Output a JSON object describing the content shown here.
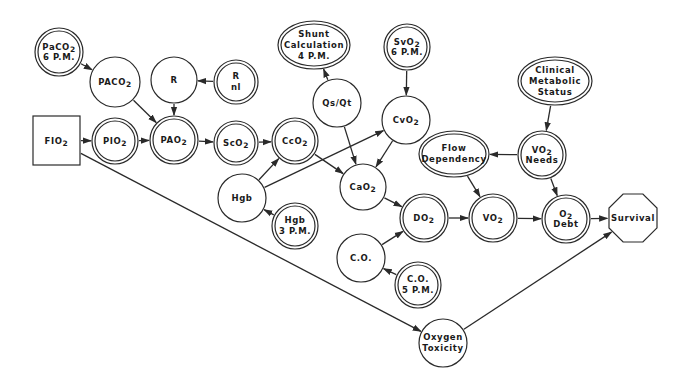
{
  "diagram": {
    "type": "influence-diagram",
    "colors": {
      "line": "#2a2a2a",
      "background": "#ffffff",
      "text": "#1a1a1a"
    },
    "nodes": [
      {
        "id": "paco2_6pm",
        "lines": [
          "PaCO2",
          "6 P.M."
        ],
        "shape": "double-circle",
        "cx": 59,
        "cy": 52,
        "r": 24
      },
      {
        "id": "paco2_alv",
        "lines": [
          "PACO2"
        ],
        "shape": "circle",
        "cx": 115,
        "cy": 82,
        "r": 25
      },
      {
        "id": "r",
        "lines": [
          "R"
        ],
        "shape": "circle",
        "cx": 174,
        "cy": 80,
        "r": 23
      },
      {
        "id": "r_nl",
        "lines": [
          "R",
          "nl"
        ],
        "shape": "double-circle",
        "cx": 236,
        "cy": 82,
        "r": 22
      },
      {
        "id": "shunt_calc",
        "lines": [
          "Shunt",
          "Calculation",
          "4 P.M."
        ],
        "shape": "double-ellipse",
        "cx": 314,
        "cy": 45,
        "rx": 36,
        "ry": 24
      },
      {
        "id": "svo2_6pm",
        "lines": [
          "SvO2",
          "6 P.M."
        ],
        "shape": "double-circle",
        "cx": 407,
        "cy": 47,
        "r": 23
      },
      {
        "id": "clinical_metabolic",
        "lines": [
          "Clinical",
          "Metabolic",
          "Status"
        ],
        "shape": "double-ellipse",
        "cx": 555,
        "cy": 81,
        "rx": 37,
        "ry": 24
      },
      {
        "id": "qs_qt",
        "lines": [
          "Qs/Qt"
        ],
        "shape": "circle",
        "cx": 337,
        "cy": 103,
        "r": 24
      },
      {
        "id": "cvo2",
        "lines": [
          "CvO2"
        ],
        "shape": "circle",
        "cx": 406,
        "cy": 120,
        "r": 24
      },
      {
        "id": "fio2",
        "lines": [
          "FIO2"
        ],
        "shape": "rect",
        "x": 33,
        "y": 116,
        "w": 47,
        "h": 49
      },
      {
        "id": "pio2",
        "lines": [
          "PIO2"
        ],
        "shape": "double-circle",
        "cx": 115,
        "cy": 141,
        "r": 23
      },
      {
        "id": "pao2",
        "lines": [
          "PAO2"
        ],
        "shape": "double-circle",
        "cx": 174,
        "cy": 140,
        "r": 24
      },
      {
        "id": "sco2",
        "lines": [
          "ScO2"
        ],
        "shape": "double-circle",
        "cx": 236,
        "cy": 143,
        "r": 22
      },
      {
        "id": "cco2",
        "lines": [
          "CcO2"
        ],
        "shape": "double-circle",
        "cx": 295,
        "cy": 141,
        "r": 23
      },
      {
        "id": "flow_dependency",
        "lines": [
          "Flow",
          "Dependency"
        ],
        "shape": "double-ellipse",
        "cx": 454,
        "cy": 154,
        "rx": 35,
        "ry": 23
      },
      {
        "id": "vo2_needs",
        "lines": [
          "VO2",
          "Needs"
        ],
        "shape": "double-circle",
        "cx": 542,
        "cy": 155,
        "r": 24
      },
      {
        "id": "cao2",
        "lines": [
          "CaO2"
        ],
        "shape": "circle",
        "cx": 363,
        "cy": 187,
        "r": 23
      },
      {
        "id": "hgb",
        "lines": [
          "Hgb"
        ],
        "shape": "circle",
        "cx": 242,
        "cy": 198,
        "r": 24
      },
      {
        "id": "hgb_3pm",
        "lines": [
          "Hgb",
          "3 P.M."
        ],
        "shape": "double-circle",
        "cx": 295,
        "cy": 226,
        "r": 23
      },
      {
        "id": "do2",
        "lines": [
          "DO2"
        ],
        "shape": "double-circle",
        "cx": 424,
        "cy": 218,
        "r": 24
      },
      {
        "id": "vo2",
        "lines": [
          "VO2"
        ],
        "shape": "double-circle",
        "cx": 493,
        "cy": 218,
        "r": 24
      },
      {
        "id": "o2_debt",
        "lines": [
          "O2",
          "Debt"
        ],
        "shape": "double-circle",
        "cx": 566,
        "cy": 219,
        "r": 24
      },
      {
        "id": "survival",
        "lines": [
          "Survival"
        ],
        "shape": "octagon",
        "cx": 633,
        "cy": 218,
        "r": 26
      },
      {
        "id": "co",
        "lines": [
          "C.O."
        ],
        "shape": "circle",
        "cx": 361,
        "cy": 258,
        "r": 24
      },
      {
        "id": "co_5pm",
        "lines": [
          "C.O.",
          "5 P.M."
        ],
        "shape": "double-circle",
        "cx": 418,
        "cy": 285,
        "r": 23
      },
      {
        "id": "oxygen_toxicity",
        "lines": [
          "Oxygen",
          "Toxicity"
        ],
        "shape": "circle",
        "cx": 443,
        "cy": 343,
        "r": 24
      }
    ],
    "edges": [
      {
        "from": "paco2_6pm",
        "to": "paco2_alv",
        "arrow": "end"
      },
      {
        "from": "paco2_alv",
        "to": "pao2",
        "arrow": "end"
      },
      {
        "from": "r_nl",
        "to": "r",
        "arrow": "end"
      },
      {
        "from": "r",
        "to": "pao2",
        "arrow": "end"
      },
      {
        "from": "fio2",
        "to": "pio2",
        "arrow": "end"
      },
      {
        "from": "pio2",
        "to": "pao2",
        "arrow": "end"
      },
      {
        "from": "pao2",
        "to": "sco2",
        "arrow": "end"
      },
      {
        "from": "sco2",
        "to": "cco2",
        "arrow": "end"
      },
      {
        "from": "shunt_calc",
        "to": "qs_qt",
        "arrow": "start"
      },
      {
        "from": "qs_qt",
        "to": "cao2",
        "arrow": "end"
      },
      {
        "from": "svo2_6pm",
        "to": "cvo2",
        "arrow": "end"
      },
      {
        "from": "cvo2",
        "to": "cao2",
        "arrow": "end"
      },
      {
        "from": "cco2",
        "to": "cao2",
        "arrow": "end"
      },
      {
        "from": "hgb",
        "to": "cco2",
        "arrow": "end"
      },
      {
        "from": "hgb",
        "to": "cvo2",
        "arrow": "end"
      },
      {
        "from": "hgb",
        "to": "hgb_3pm",
        "arrow": "start"
      },
      {
        "from": "cao2",
        "to": "do2",
        "arrow": "end"
      },
      {
        "from": "co",
        "to": "do2",
        "arrow": "end"
      },
      {
        "from": "co",
        "to": "co_5pm",
        "arrow": "start"
      },
      {
        "from": "do2",
        "to": "vo2",
        "arrow": "end"
      },
      {
        "from": "vo2",
        "to": "o2_debt",
        "arrow": "end"
      },
      {
        "from": "o2_debt",
        "to": "survival",
        "arrow": "end"
      },
      {
        "from": "clinical_metabolic",
        "to": "vo2_needs",
        "arrow": "end"
      },
      {
        "from": "vo2_needs",
        "to": "flow_dependency",
        "arrow": "end"
      },
      {
        "from": "flow_dependency",
        "to": "vo2",
        "arrow": "end"
      },
      {
        "from": "vo2_needs",
        "to": "o2_debt",
        "arrow": "end"
      },
      {
        "from": "fio2",
        "to": "oxygen_toxicity",
        "arrow": "end"
      },
      {
        "from": "oxygen_toxicity",
        "to": "survival",
        "arrow": "end"
      }
    ]
  }
}
